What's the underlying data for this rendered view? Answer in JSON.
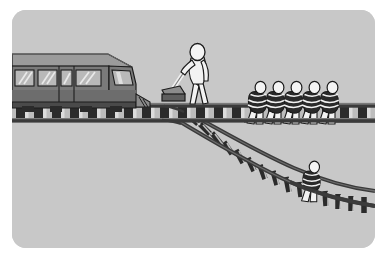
{
  "illustration": {
    "title": "Trolley problem illustration",
    "scene_name": "trolley-problem-scene",
    "background_color": "#c8c8c8",
    "frame_color": "#ffffff",
    "frame_corner_radius": "14px",
    "canvas": {
      "width": 387,
      "height": 258
    }
  },
  "palette": {
    "background": "#c8c8c8",
    "outline": "#1c1c1c",
    "rail_dark": "#3a3a3a",
    "rail_mid": "#585858",
    "sleeper_dark": "#2b2b2b",
    "sleeper_light": "#d8d8d8",
    "tram_body": "#7a7a7a",
    "tram_body_shadow": "#636363",
    "tram_roof": "#9b9b9b",
    "tram_window": "#b5b5b5",
    "tram_window_highlight": "#e8e8e8",
    "tram_underframe": "#4a4a4a",
    "figure_fill": "#f2f2f2",
    "figure_shadow": "#bcbcbc",
    "binding_dark": "#242424",
    "lever_box": "#6e6e6e"
  },
  "elements": {
    "tram": {
      "label": "Tram",
      "description": "Grey tram car approaching from the left along the main track",
      "window_count": 4,
      "wheel_count": 4
    },
    "bystander": {
      "label": "Bystander at the switch lever",
      "description": "White stick figure standing beside the track holding the switch lever",
      "count": 1
    },
    "lever": {
      "label": "Switch lever",
      "description": "Lever and grey switch box that diverts the tram onto the side track"
    },
    "main_track": {
      "label": "Main track",
      "description": "Straight horizontal track running left to right"
    },
    "side_track": {
      "label": "Side track",
      "description": "Branch track curving down to the bottom right"
    },
    "switch_point": {
      "label": "Track switch",
      "description": "Junction where the side track branches from the main track"
    },
    "group_victims": {
      "label": "Five people tied to the main track",
      "count": 5,
      "track": "main_track"
    },
    "lone_victim": {
      "label": "One person tied to the side track",
      "count": 1,
      "track": "side_track"
    }
  },
  "figures": {
    "group_positions": [
      258,
      276.5,
      295,
      313.5,
      332
    ],
    "group_baseline_y": 106,
    "lone_position": {
      "x": 300,
      "y": 168
    }
  }
}
